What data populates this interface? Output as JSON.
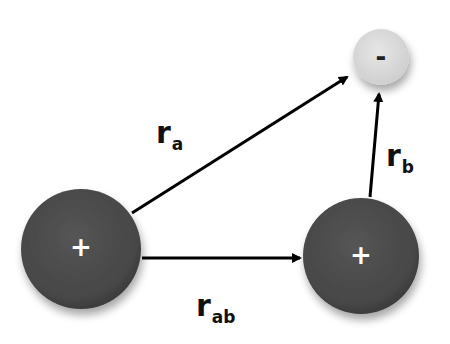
{
  "diagram": {
    "particles": [
      {
        "id": "left-positive",
        "charge": "+",
        "cx": 81,
        "cy": 249,
        "r": 60,
        "color": "#4a4a4a",
        "text_color": "#ffffff"
      },
      {
        "id": "right-positive",
        "charge": "+",
        "cx": 361,
        "cy": 256,
        "r": 58,
        "color": "#4a4a4a",
        "text_color": "#ffffff"
      },
      {
        "id": "negative",
        "charge": "-",
        "cx": 381,
        "cy": 57,
        "r": 28,
        "color": "#dcdcdc",
        "text_color": "#222222"
      }
    ],
    "vectors": [
      {
        "id": "r_a",
        "from": "left-positive",
        "to": "negative",
        "label_main": "r",
        "label_sub": "a"
      },
      {
        "id": "r_b",
        "from": "right-positive",
        "to": "negative",
        "label_main": "r",
        "label_sub": "b"
      },
      {
        "id": "r_ab",
        "from": "left-positive",
        "to": "right-positive",
        "label_main": "r",
        "label_sub": "ab"
      }
    ]
  }
}
